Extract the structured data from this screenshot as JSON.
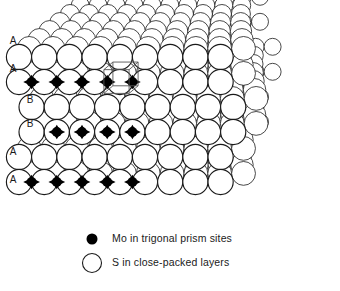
{
  "figure": {
    "background_color": "#ffffff",
    "line_color": "#1a1a1a",
    "sphere_fill": "#ffffff",
    "mo_fill": "#000000",
    "unit_cell_color": "#555555"
  },
  "layer_labels": [
    {
      "label": "A",
      "x": 13,
      "y": 41
    },
    {
      "label": "A",
      "x": 13,
      "y": 69
    },
    {
      "label": "B",
      "x": 30,
      "y": 100
    },
    {
      "label": "B",
      "x": 30,
      "y": 124
    },
    {
      "label": "A",
      "x": 13,
      "y": 152
    },
    {
      "label": "A",
      "x": 13,
      "y": 180
    }
  ],
  "legend": {
    "items": [
      {
        "marker": "filled-circle",
        "marker_color": "#000000",
        "marker_radius": 5.5,
        "marker_x": 92,
        "marker_y": 239,
        "text": "Mo in trigonal prism sites",
        "text_x": 112,
        "text_y": 239
      },
      {
        "marker": "open-circle",
        "marker_color": "#ffffff",
        "marker_radius": 9.5,
        "marker_x": 92,
        "marker_y": 263,
        "text": "S in close-packed layers",
        "text_x": 112,
        "text_y": 263
      }
    ]
  },
  "chart_data": {
    "type": "diagram",
    "structure": "MoS2 layered close-packed lattice",
    "stacking_sequence": [
      "A",
      "A",
      "B",
      "B",
      "A",
      "A"
    ],
    "sphere_label": "S",
    "site_label": "Mo",
    "site_geometry": "trigonal prism",
    "mo_rows": [
      {
        "row": "top",
        "count": 5,
        "y": 82
      },
      {
        "row": "middle",
        "count": 4,
        "y": 132
      },
      {
        "row": "bottom",
        "count": 5,
        "y": 182
      }
    ],
    "unit_cell_marked": true,
    "unit_cell_anchor": {
      "x": 117,
      "y": 82
    }
  },
  "geometry": {
    "front_radius": 12.6,
    "col_step": 25.2,
    "row_step": 25.0,
    "depth_dx": 10.2,
    "depth_dy": -8.6,
    "depth_shrink": 0.945,
    "front_cols": 9,
    "depth_steps": 7,
    "origin_x": 19,
    "front_rows": [
      {
        "y": 57,
        "offset": 0,
        "band": "A"
      },
      {
        "y": 82,
        "offset": 0,
        "band": "A"
      },
      {
        "y": 107,
        "offset": 0.5,
        "band": "B"
      },
      {
        "y": 132,
        "offset": 0.5,
        "band": "B"
      },
      {
        "y": 157,
        "offset": 0,
        "band": "A"
      },
      {
        "y": 182,
        "offset": 0,
        "band": "A"
      }
    ]
  }
}
